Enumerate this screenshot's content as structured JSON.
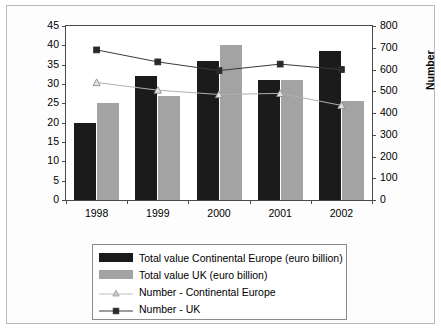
{
  "chart_data": {
    "type": "bar",
    "title": "",
    "categories": [
      "1998",
      "1999",
      "2000",
      "2001",
      "2002"
    ],
    "xlabel": "",
    "ylabel": "Euro billion",
    "y2label": "Number",
    "ylim": [
      0,
      45
    ],
    "y2lim": [
      0,
      800
    ],
    "y_ticks": [
      "0",
      "5",
      "10",
      "15",
      "20",
      "25",
      "30",
      "35",
      "40",
      "45"
    ],
    "y2_ticks": [
      "0",
      "100",
      "200",
      "300",
      "400",
      "500",
      "600",
      "700",
      "800"
    ],
    "grid": false,
    "legend_position": "bottom",
    "series": [
      {
        "name": "Total value Continental Europe (euro billion)",
        "type": "bar",
        "axis": "left",
        "color": "#1b1b1b",
        "values": [
          20,
          32,
          36,
          31,
          38.5
        ]
      },
      {
        "name": "Total value UK (euro billion)",
        "type": "bar",
        "axis": "left",
        "color": "#a3a3a3",
        "values": [
          25,
          27,
          40,
          31,
          25.5
        ]
      },
      {
        "name": "Number - Continental Europe",
        "type": "line",
        "axis": "right",
        "marker": "triangle",
        "color": "#b0b0b0",
        "values": [
          540,
          505,
          485,
          490,
          435
        ]
      },
      {
        "name": "Number - UK",
        "type": "line",
        "axis": "right",
        "marker": "square",
        "color": "#3a3a3a",
        "values": [
          690,
          635,
          595,
          625,
          600
        ]
      }
    ]
  },
  "legend": {
    "items": [
      {
        "label": "Total value Continental Europe (euro billion)",
        "key": "swatch-dark-icon"
      },
      {
        "label": "Total value UK (euro billion)",
        "key": "swatch-grey-icon"
      },
      {
        "label": "Number - Continental Europe",
        "key": "line-triangle-icon"
      },
      {
        "label": "Number - UK",
        "key": "line-square-icon"
      }
    ]
  }
}
